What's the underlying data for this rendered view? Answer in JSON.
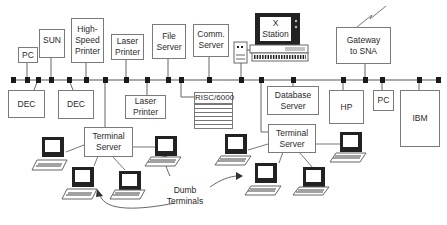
{
  "diagram": {
    "type": "network-topology",
    "bus": {
      "label": "LAN backbone"
    },
    "devices_top": [
      {
        "id": "pc-left",
        "label": "PC"
      },
      {
        "id": "sun",
        "label": "SUN"
      },
      {
        "id": "high-speed-printer",
        "label": "High-\nSpeed\nPrinter"
      },
      {
        "id": "laser-printer-top",
        "label": "Laser\nPrinter"
      },
      {
        "id": "file-server",
        "label": "File\nServer"
      },
      {
        "id": "comm-server",
        "label": "Comm.\nServer"
      },
      {
        "id": "x-station",
        "label": "X\nStation"
      },
      {
        "id": "gateway-sna",
        "label": "Gateway\nto SNA"
      }
    ],
    "devices_bottom": [
      {
        "id": "dec-1",
        "label": "DEC"
      },
      {
        "id": "dec-2",
        "label": "DEC"
      },
      {
        "id": "laser-printer-bottom",
        "label": "Laser\nPrinter"
      },
      {
        "id": "risc-6000",
        "label": "RISC/6000"
      },
      {
        "id": "database-server",
        "label": "Database\nServer"
      },
      {
        "id": "hp",
        "label": "HP"
      },
      {
        "id": "pc-right",
        "label": "PC"
      },
      {
        "id": "ibm",
        "label": "IBM"
      }
    ],
    "terminal_servers": [
      {
        "id": "terminal-server-1",
        "label": "Terminal\nServer"
      },
      {
        "id": "terminal-server-2",
        "label": "Terminal\nServer"
      }
    ],
    "annotation": {
      "label": "Dumb\nTerminals"
    }
  }
}
